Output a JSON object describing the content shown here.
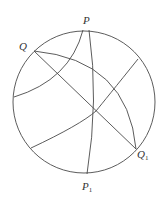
{
  "diagram": {
    "type": "stereographic-projection",
    "stroke_color": "#4a4a4a",
    "background": "#ffffff",
    "primitive_circle": {
      "cx": 84,
      "cy": 102,
      "r": 71
    },
    "labels": {
      "P": {
        "text": "P",
        "sub": ""
      },
      "Q": {
        "text": "Q",
        "sub": ""
      },
      "P1": {
        "text": "P",
        "sub": "1"
      },
      "Q1": {
        "text": "Q",
        "sub": "1"
      }
    },
    "points": {
      "P": [
        89,
        30
      ],
      "Q": [
        34,
        51
      ],
      "P1": [
        87,
        174
      ],
      "Q1": [
        136,
        149
      ],
      "center_intersection": [
        96,
        111
      ]
    },
    "curves": [
      {
        "name": "great-circle-P-P1",
        "d": "M89,30 Q99,100 87,174"
      },
      {
        "name": "great-circle-Q-Q1-straight",
        "d": "M34,51 L136,149"
      },
      {
        "name": "great-circle-Q-Q1-arc",
        "d": "M34,51 Q128,60 136,149"
      },
      {
        "name": "small-arc-upper-left",
        "d": "M83,30 Q70,80 14,97"
      },
      {
        "name": "great-circle-diagonal",
        "d": "M138,59 Q105,100 96,111 Q80,125 31,148"
      }
    ]
  }
}
